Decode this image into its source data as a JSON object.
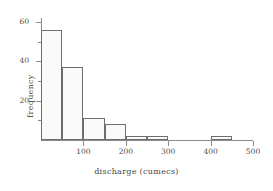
{
  "chart_data": {
    "type": "bar",
    "title": "",
    "subtitle": "",
    "xlabel": "discharge (cumecs)",
    "ylabel": "frequency",
    "xlim": [
      0,
      500
    ],
    "ylim": [
      0,
      62
    ],
    "grid": false,
    "legend": null,
    "bin_width": 50,
    "bin_edges": [
      0,
      50,
      100,
      150,
      200,
      250,
      300,
      350,
      400,
      450,
      500
    ],
    "categories": [
      "0-50",
      "50-100",
      "100-150",
      "150-200",
      "200-250",
      "250-300",
      "300-350",
      "350-400",
      "400-450",
      "450-500"
    ],
    "values": [
      56,
      37,
      11,
      8,
      2,
      2,
      0,
      0,
      2,
      0
    ],
    "bars": [
      {
        "label": "0-50",
        "start": 0,
        "end": 50,
        "value": 56
      },
      {
        "label": "50-100",
        "start": 50,
        "end": 100,
        "value": 37
      },
      {
        "label": "100-150",
        "start": 100,
        "end": 150,
        "value": 11
      },
      {
        "label": "150-200",
        "start": 150,
        "end": 200,
        "value": 8
      },
      {
        "label": "200-250",
        "start": 200,
        "end": 250,
        "value": 2
      },
      {
        "label": "250-300",
        "start": 250,
        "end": 300,
        "value": 2
      },
      {
        "label": "400-450",
        "start": 400,
        "end": 450,
        "value": 2
      }
    ],
    "x_ticks": [
      {
        "value": 100,
        "label": "100"
      },
      {
        "value": 200,
        "label": "200"
      },
      {
        "value": 300,
        "label": "300"
      },
      {
        "value": 400,
        "label": "400"
      },
      {
        "value": 500,
        "label": "500"
      }
    ],
    "y_ticks_major": [
      {
        "value": 20,
        "label": "20"
      },
      {
        "value": 40,
        "label": "40"
      },
      {
        "value": 60,
        "label": "60"
      }
    ],
    "y_ticks_minor": [
      10,
      30,
      50
    ],
    "colors": {
      "bar_fill": "#fafafa",
      "bar_stroke": "#6e6e6e",
      "axis": "#8c8c8c",
      "text": "#3f3f3f",
      "background": "#ffffff"
    }
  }
}
